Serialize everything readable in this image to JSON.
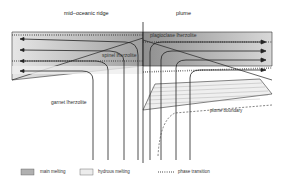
{
  "diagram": {
    "panels": {
      "left": {
        "title": "mid–oceanic ridge"
      },
      "right": {
        "title": "plume"
      }
    },
    "zones": {
      "plagioclase": "plagioclase lherzolite",
      "spinel": "spinel lherzolite",
      "garnet": "garnet lherzolite",
      "plume_boundary": "plume boundary"
    },
    "legend": {
      "main_melting": "main melting",
      "hydrous_melting": "hydrous melting",
      "phase_transition": "phase transition"
    },
    "colors": {
      "main_melting": "#a8a8a8",
      "hydrous_melting": "#e8e8e8",
      "line": "#222222"
    }
  }
}
